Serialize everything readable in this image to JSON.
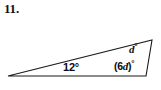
{
  "problem": {
    "number": "11."
  },
  "figure": {
    "shape_name": "triangle",
    "stroke_color": "#1a1a1a",
    "fill_color": "#ffffff",
    "vertices": [
      {
        "name": "left-vertex",
        "x": 8,
        "y": 76
      },
      {
        "name": "top-right-vertex",
        "x": 152,
        "y": 40
      },
      {
        "name": "bottom-right-vertex",
        "x": 146,
        "y": 76
      }
    ],
    "labels": {
      "base_left_angle": "12°",
      "apex_right_angle_var": "d",
      "apex_right_angle_deg": "°",
      "base_right_angle_open": "(6",
      "base_right_angle_var": "d",
      "base_right_angle_close": ")",
      "base_right_angle_deg": "°"
    }
  }
}
